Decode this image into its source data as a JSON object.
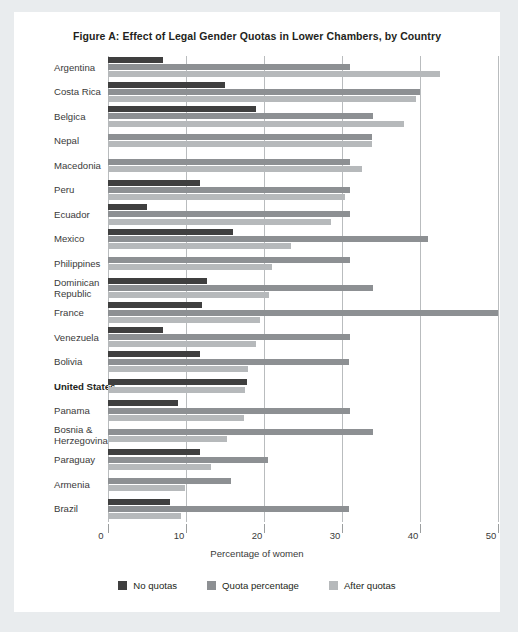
{
  "figure": {
    "title": "Figure A: Effect of Legal Gender Quotas in Lower Chambers, by Country",
    "xlabel": "Percentage of women"
  },
  "legend": {
    "items": [
      {
        "label": "No quotas",
        "color": "#3f3f3f"
      },
      {
        "label": "Quota percentage",
        "color": "#8d9093"
      },
      {
        "label": "After quotas",
        "color": "#b6b9bb"
      }
    ]
  },
  "axis": {
    "ticks": [
      "0",
      "10",
      "20",
      "30",
      "40",
      "50"
    ]
  },
  "chart_data": {
    "type": "bar",
    "orientation": "horizontal",
    "title": "Figure A: Effect of Legal Gender Quotas in Lower Chambers, by Country",
    "xlabel": "Percentage of women",
    "ylabel": "",
    "xlim": [
      0,
      50
    ],
    "xticks": [
      0,
      10,
      20,
      30,
      40,
      50
    ],
    "grid": "vertical",
    "legend_position": "bottom",
    "categories": [
      "Argentina",
      "Costa Rica",
      "Belgica",
      "Nepal",
      "Macedonia",
      "Peru",
      "Ecuador",
      "Mexico",
      "Philippines",
      "Dominican Republic",
      "France",
      "Venezuela",
      "Bolivia",
      "United States",
      "Panama",
      "Bosnia & Herzegovina",
      "Paraguay",
      "Armenia",
      "Brazil"
    ],
    "highlighted_category": "United States",
    "series": [
      {
        "name": "No quotas",
        "color": "#3f3f3f",
        "values": [
          7,
          15,
          19,
          null,
          null,
          11.8,
          5,
          16,
          null,
          12.7,
          12,
          7,
          11.8,
          17.8,
          9,
          null,
          11.8,
          null,
          8
        ]
      },
      {
        "name": "Quota percentage",
        "color": "#8d9093",
        "values": [
          31,
          40,
          34,
          33.8,
          31,
          31,
          31,
          41,
          31,
          34,
          50,
          31,
          30.9,
          null,
          31,
          34,
          20.5,
          15.8,
          30.9
        ]
      },
      {
        "name": "After quotas",
        "color": "#b6b9bb",
        "values": [
          42.5,
          39.5,
          38,
          33.8,
          32.5,
          30.4,
          28.6,
          23.5,
          21,
          20.6,
          19.5,
          19,
          18,
          17.5,
          17.4,
          15.3,
          13.2,
          9.9,
          9.4
        ]
      }
    ]
  }
}
